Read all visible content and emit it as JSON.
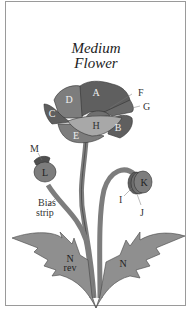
{
  "title": {
    "line1": "Medium",
    "line2": "Flower"
  },
  "pieces": {
    "A": "A",
    "B": "B",
    "C": "C",
    "D": "D",
    "E": "E",
    "F": "F",
    "G": "G",
    "H": "H",
    "I": "I",
    "J": "J",
    "K": "K",
    "L": "L",
    "M": "M",
    "N_left": "N",
    "N_left_note": "rev",
    "N_right": "N"
  },
  "annotations": {
    "bias_strip_line1": "Bias",
    "bias_strip_line2": "strip"
  },
  "colors": {
    "dark": "#5f5f5f",
    "medium": "#7d7d7d",
    "light": "#a8a8a8",
    "leaf": "#8f8f8f",
    "frame": "#9a9a9a"
  }
}
